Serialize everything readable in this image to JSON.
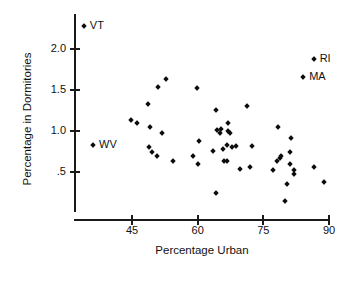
{
  "chart_data": {
    "type": "scatter",
    "title": "",
    "xlabel": "Percentage Urban",
    "ylabel": "Percentage in Dormitories",
    "xlim": [
      33,
      92
    ],
    "ylim": [
      0.1,
      2.35
    ],
    "xticks": [
      45,
      60,
      75,
      90
    ],
    "xtick_labels": [
      "45",
      "60",
      "75",
      "90"
    ],
    "yticks": [
      2.0,
      1.5,
      1.0,
      0.5
    ],
    "ytick_labels": [
      "2.0",
      "1.5",
      "1.0",
      ".5"
    ],
    "grid": false,
    "legend": "none",
    "marker": "diamond",
    "marker_color": "#0d0d0d",
    "axis_color": "#1a1a1a",
    "points": [
      {
        "x": 34.0,
        "y": 2.28,
        "label": "VT"
      },
      {
        "x": 36.1,
        "y": 0.83,
        "label": "WV"
      },
      {
        "x": 86.5,
        "y": 1.88,
        "label": "RI"
      },
      {
        "x": 84.1,
        "y": 1.66,
        "label": "MA"
      },
      {
        "x": 44.8,
        "y": 1.13,
        "label": ""
      },
      {
        "x": 46.2,
        "y": 1.1,
        "label": ""
      },
      {
        "x": 49.1,
        "y": 1.05,
        "label": ""
      },
      {
        "x": 48.6,
        "y": 1.33,
        "label": ""
      },
      {
        "x": 50.9,
        "y": 1.54,
        "label": ""
      },
      {
        "x": 52.7,
        "y": 1.63,
        "label": ""
      },
      {
        "x": 51.8,
        "y": 0.98,
        "label": ""
      },
      {
        "x": 48.9,
        "y": 0.8,
        "label": ""
      },
      {
        "x": 49.6,
        "y": 0.74,
        "label": ""
      },
      {
        "x": 50.6,
        "y": 0.7,
        "label": ""
      },
      {
        "x": 54.3,
        "y": 0.63,
        "label": ""
      },
      {
        "x": 59.8,
        "y": 1.53,
        "label": ""
      },
      {
        "x": 60.2,
        "y": 0.88,
        "label": ""
      },
      {
        "x": 58.9,
        "y": 0.7,
        "label": ""
      },
      {
        "x": 60.1,
        "y": 0.6,
        "label": ""
      },
      {
        "x": 64.3,
        "y": 1.26,
        "label": ""
      },
      {
        "x": 63.4,
        "y": 0.76,
        "label": ""
      },
      {
        "x": 64.5,
        "y": 1.01,
        "label": ""
      },
      {
        "x": 65.0,
        "y": 0.98,
        "label": ""
      },
      {
        "x": 65.3,
        "y": 1.03,
        "label": ""
      },
      {
        "x": 65.8,
        "y": 0.78,
        "label": ""
      },
      {
        "x": 66.7,
        "y": 0.83,
        "label": ""
      },
      {
        "x": 67.0,
        "y": 1.1,
        "label": ""
      },
      {
        "x": 66.9,
        "y": 1.0,
        "label": ""
      },
      {
        "x": 67.4,
        "y": 0.97,
        "label": ""
      },
      {
        "x": 67.8,
        "y": 0.8,
        "label": ""
      },
      {
        "x": 68.8,
        "y": 0.82,
        "label": ""
      },
      {
        "x": 66.0,
        "y": 0.64,
        "label": ""
      },
      {
        "x": 66.7,
        "y": 0.64,
        "label": ""
      },
      {
        "x": 64.2,
        "y": 0.24,
        "label": ""
      },
      {
        "x": 71.3,
        "y": 1.3,
        "label": ""
      },
      {
        "x": 72.5,
        "y": 0.82,
        "label": ""
      },
      {
        "x": 69.7,
        "y": 0.54,
        "label": ""
      },
      {
        "x": 72.0,
        "y": 0.56,
        "label": ""
      },
      {
        "x": 78.4,
        "y": 1.05,
        "label": ""
      },
      {
        "x": 77.1,
        "y": 0.52,
        "label": ""
      },
      {
        "x": 78.2,
        "y": 0.63,
        "label": ""
      },
      {
        "x": 78.7,
        "y": 0.67,
        "label": ""
      },
      {
        "x": 79.0,
        "y": 0.7,
        "label": ""
      },
      {
        "x": 81.3,
        "y": 0.91,
        "label": ""
      },
      {
        "x": 81.0,
        "y": 0.75,
        "label": ""
      },
      {
        "x": 81.2,
        "y": 0.6,
        "label": ""
      },
      {
        "x": 82.0,
        "y": 0.52,
        "label": ""
      },
      {
        "x": 81.9,
        "y": 0.47,
        "label": ""
      },
      {
        "x": 80.3,
        "y": 0.35,
        "label": ""
      },
      {
        "x": 80.0,
        "y": 0.15,
        "label": ""
      },
      {
        "x": 86.5,
        "y": 0.56,
        "label": ""
      },
      {
        "x": 88.8,
        "y": 0.38,
        "label": ""
      }
    ]
  }
}
